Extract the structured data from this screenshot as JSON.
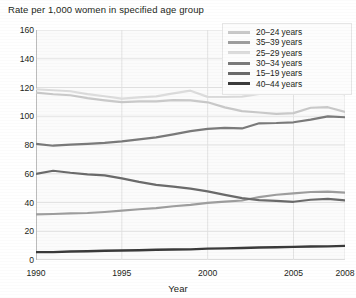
{
  "chart_data": {
    "type": "line",
    "title": "Rate per 1,000 women in specified age group",
    "xlabel": "Year",
    "ylabel": "",
    "xlim": [
      1990,
      2008
    ],
    "ylim": [
      0,
      160
    ],
    "grid": true,
    "legend_position": "top-right",
    "x": [
      1990,
      1991,
      1992,
      1993,
      1994,
      1995,
      1996,
      1997,
      1998,
      1999,
      2000,
      2001,
      2002,
      2003,
      2004,
      2005,
      2006,
      2007,
      2008
    ],
    "xticks": [
      "1990",
      "1995",
      "2000",
      "2005",
      "2008"
    ],
    "xtick_values": [
      1990,
      1995,
      2000,
      2005,
      2008
    ],
    "yticks": [
      "0",
      "20",
      "40",
      "60",
      "80",
      "100",
      "120",
      "140",
      "160"
    ],
    "ytick_values": [
      0,
      20,
      40,
      60,
      80,
      100,
      120,
      140,
      160
    ],
    "series": [
      {
        "name": "20–24 years",
        "color": "#c9c9c9",
        "width": 2.2,
        "values": [
          116.5,
          115.3,
          114.6,
          112.6,
          111.1,
          109.8,
          110.4,
          110.4,
          111.2,
          111.0,
          109.7,
          106.2,
          103.6,
          102.6,
          101.7,
          102.2,
          105.9,
          106.3,
          103.0
        ]
      },
      {
        "name": "35–39 years",
        "color": "#9e9e9e",
        "width": 2.2,
        "values": [
          31.7,
          32.0,
          32.5,
          32.7,
          33.4,
          34.3,
          35.3,
          36.1,
          37.4,
          38.3,
          39.7,
          40.6,
          41.4,
          43.8,
          45.4,
          46.3,
          47.3,
          47.5,
          46.9
        ]
      },
      {
        "name": "25–29 years",
        "color": "#dcdcdc",
        "width": 2.2,
        "values": [
          118.8,
          118.1,
          117.4,
          115.4,
          113.9,
          112.2,
          113.1,
          113.8,
          115.9,
          117.8,
          113.5,
          113.4,
          113.6,
          115.6,
          115.5,
          115.5,
          116.8,
          117.5,
          115.1
        ]
      },
      {
        "name": "30–34 years",
        "color": "#7a7a7a",
        "width": 2.2,
        "values": [
          80.8,
          79.5,
          80.2,
          80.8,
          81.5,
          82.5,
          83.9,
          85.3,
          87.4,
          89.6,
          91.2,
          91.9,
          91.5,
          95.1,
          95.3,
          95.8,
          97.7,
          99.9,
          99.3
        ]
      },
      {
        "name": "15–19 years",
        "color": "#6b6b6b",
        "width": 2.2,
        "values": [
          59.9,
          62.1,
          60.7,
          59.6,
          58.9,
          56.8,
          54.4,
          52.3,
          51.1,
          49.6,
          47.7,
          45.3,
          43.0,
          41.6,
          41.1,
          40.5,
          41.9,
          42.5,
          41.5
        ]
      },
      {
        "name": "40–44 years",
        "color": "#3a3a3a",
        "width": 2.4,
        "values": [
          5.5,
          5.5,
          5.9,
          6.1,
          6.4,
          6.6,
          6.8,
          7.1,
          7.3,
          7.4,
          7.9,
          8.1,
          8.3,
          8.7,
          8.9,
          9.1,
          9.4,
          9.5,
          9.8
        ]
      }
    ]
  },
  "legend": {
    "items": [
      {
        "label": "20–24 years",
        "color": "#c9c9c9",
        "thickness": 3
      },
      {
        "label": "35–39 years",
        "color": "#9e9e9e",
        "thickness": 3
      },
      {
        "label": "25–29 years",
        "color": "#dcdcdc",
        "thickness": 3
      },
      {
        "label": "30–34 years",
        "color": "#7a7a7a",
        "thickness": 3
      },
      {
        "label": "15–19 years",
        "color": "#6b6b6b",
        "thickness": 3
      },
      {
        "label": "40–44 years",
        "color": "#3a3a3a",
        "thickness": 3.4
      }
    ]
  },
  "style": {
    "plot_background": "#fbfbfb",
    "grid_color": "#e3e3e3",
    "axis_color": "#bcbcbc",
    "text_color": "#231f20"
  }
}
